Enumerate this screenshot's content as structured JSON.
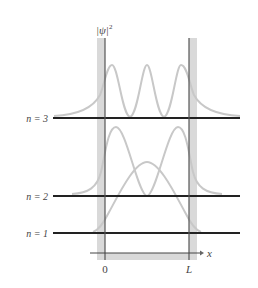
{
  "diagram": {
    "y_axis_label": "|ψ|",
    "y_axis_superscript": "2",
    "x_axis_label": "x",
    "x_ticks": [
      {
        "label": "0",
        "x": 105
      },
      {
        "label": "L",
        "x": 189
      }
    ],
    "levels": [
      {
        "label": "n = 3",
        "y": 118,
        "nodes": 3
      },
      {
        "label": "n = 2",
        "y": 196,
        "nodes": 2
      },
      {
        "label": "n = 1",
        "y": 233,
        "nodes": 1
      }
    ],
    "colors": {
      "well_wall_band": "#d9d9d9",
      "wall_line": "#555555",
      "level_line": "#222222",
      "curve": "#c8c8c8",
      "text": "#444444"
    }
  }
}
